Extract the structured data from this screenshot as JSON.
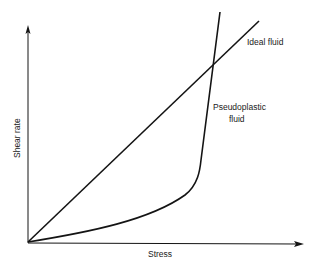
{
  "diagram": {
    "x_axis_label": "Stress",
    "y_axis_label": "Shear rate",
    "curves": [
      {
        "name": "ideal-fluid",
        "label": "Ideal fluid",
        "shape": "straight line through origin"
      },
      {
        "name": "pseudoplastic-fluid",
        "label_line1": "Pseudoplastic",
        "label_line2": "fluid",
        "shape": "concave-up curve becoming near-vertical"
      }
    ],
    "colors": {
      "line": "#141414",
      "background": "#ffffff"
    }
  }
}
